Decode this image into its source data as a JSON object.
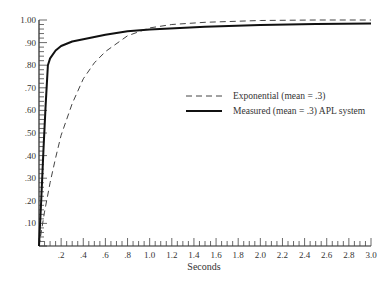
{
  "chart_data": {
    "type": "line",
    "title": "",
    "xlabel": "Seconds",
    "ylabel": "",
    "xlim": [
      0,
      3.0
    ],
    "ylim": [
      0,
      1.0
    ],
    "grid": false,
    "legend_position": "center-right",
    "x_ticks": [
      ".2",
      ".4",
      ".6",
      ".8",
      "1.0",
      "1.2",
      "1.4",
      "1.6",
      "1.8",
      "2.0",
      "2.2",
      "2.4",
      "2.6",
      "2.8",
      "3.0"
    ],
    "y_ticks": [
      ".10",
      ".20",
      ".30",
      ".40",
      ".50",
      ".60",
      ".70",
      ".80",
      ".90",
      "1.00"
    ],
    "series": [
      {
        "name": "Exponential (mean = .3)",
        "style": "dashed",
        "x": [
          0,
          0.02,
          0.05,
          0.1,
          0.15,
          0.2,
          0.3,
          0.4,
          0.5,
          0.6,
          0.8,
          1.0,
          1.2,
          1.5,
          2.0,
          2.5,
          3.0
        ],
        "y": [
          0,
          0.06,
          0.15,
          0.28,
          0.39,
          0.49,
          0.63,
          0.74,
          0.81,
          0.86,
          0.93,
          0.965,
          0.98,
          0.99,
          0.998,
          1.0,
          1.0
        ]
      },
      {
        "name": "Measured (mean = .3) APL system",
        "style": "solid",
        "x": [
          0,
          0.02,
          0.04,
          0.06,
          0.08,
          0.1,
          0.15,
          0.2,
          0.3,
          0.4,
          0.6,
          0.8,
          1.0,
          1.5,
          2.0,
          2.5,
          3.0
        ],
        "y": [
          0,
          0.2,
          0.42,
          0.62,
          0.8,
          0.83,
          0.865,
          0.885,
          0.905,
          0.915,
          0.935,
          0.95,
          0.958,
          0.97,
          0.978,
          0.982,
          0.985
        ]
      }
    ]
  },
  "legend": {
    "items": [
      {
        "label": "Exponential (mean = .3)",
        "style": "dashed"
      },
      {
        "label": "Measured (mean = .3) APL system",
        "style": "solid"
      }
    ]
  },
  "axes": {
    "x_title": "Seconds"
  }
}
